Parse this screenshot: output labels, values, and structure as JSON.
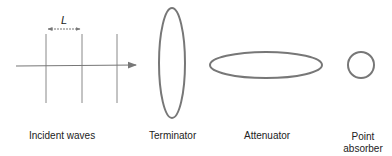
{
  "diagram": {
    "incident_waves": {
      "label": "Incident waves",
      "spacing_label": "L",
      "wave_crests": 3,
      "direction": "left-to-right"
    },
    "terminator": {
      "label": "Terminator",
      "shape": "tall-ellipse"
    },
    "attenuator": {
      "label": "Attenuator",
      "shape": "wide-ellipse"
    },
    "point_absorber": {
      "label_line1": "Point",
      "label_line2": "absorber",
      "shape": "circle"
    },
    "colors": {
      "stroke": "#777777",
      "text": "#222222"
    }
  }
}
